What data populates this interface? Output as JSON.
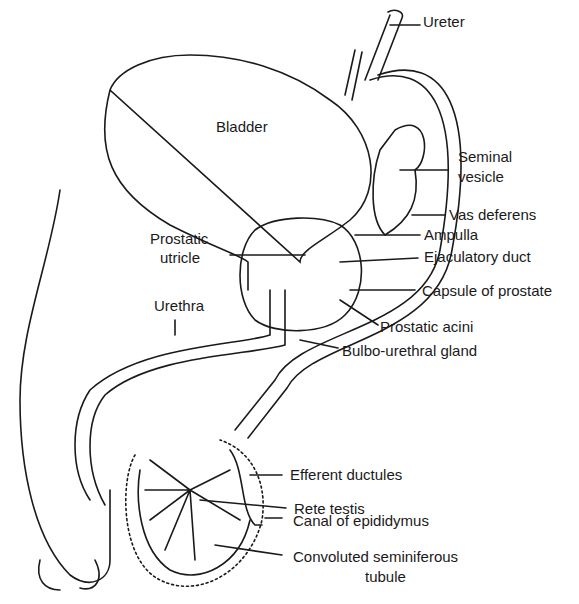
{
  "diagram": {
    "labels": {
      "ureter": "Ureter",
      "bladder": "Bladder",
      "seminal_vesicle_1": "Seminal",
      "seminal_vesicle_2": "vesicle",
      "vas_deferens": "Vas deferens",
      "ampulla": "Ampulla",
      "prostatic_utricle_1": "Prostatic",
      "prostatic_utricle_2": "utricle",
      "ejaculatory_duct": "Ejaculatory duct",
      "capsule_of_prostate": "Capsule of prostate",
      "urethra": "Urethra",
      "prostatic_acini": "Prostatic acini",
      "bulbo_urethral_gland": "Bulbo-urethral gland",
      "efferent_ductules": "Efferent ductules",
      "rete_testis": "Rete testis",
      "canal_of_epididymus": "Canal of epididymus",
      "convoluted_1": "Convoluted seminiferous",
      "convoluted_2": "tubule"
    }
  }
}
